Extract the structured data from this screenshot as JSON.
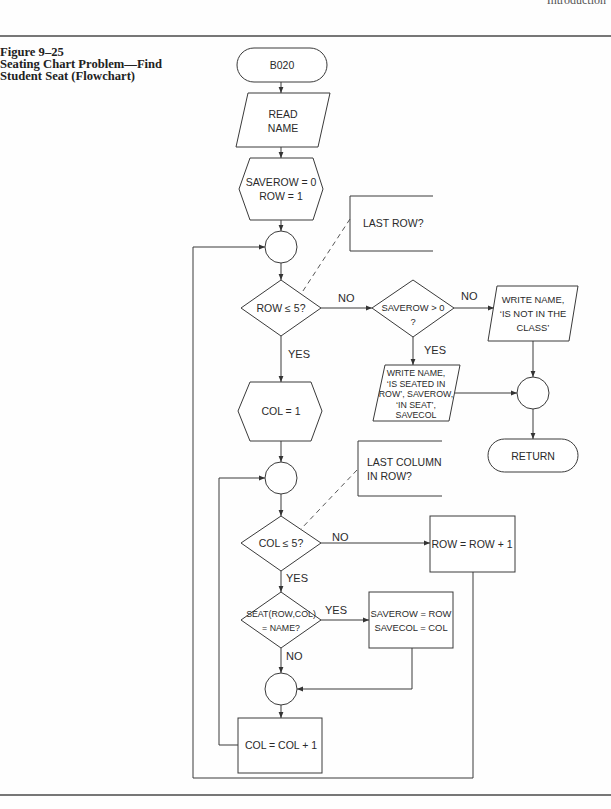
{
  "page": {
    "running_header": "Introduction"
  },
  "figure": {
    "label": "Figure 9–25",
    "caption_lines": [
      "Seating Chart Problem—Find",
      "Student Seat (Flowchart)"
    ]
  },
  "flowchart": {
    "nodes": {
      "start": {
        "shape": "terminal",
        "text": "B020"
      },
      "read_name": {
        "shape": "input-output",
        "lines": [
          "READ",
          "NAME"
        ]
      },
      "init_row": {
        "shape": "preparation",
        "lines": [
          "SAVEROW = 0",
          "ROW = 1"
        ]
      },
      "row_loop_connector": {
        "shape": "connector"
      },
      "row_test": {
        "shape": "decision",
        "text": "ROW ≤ 5?"
      },
      "found_test": {
        "shape": "decision",
        "lines": [
          "SAVEROW > 0",
          "?"
        ]
      },
      "write_not_in_class": {
        "shape": "input-output",
        "lines": [
          "WRITE NAME,",
          "‘IS NOT IN THE",
          "CLASS’"
        ]
      },
      "write_seated": {
        "shape": "input-output",
        "lines": [
          "WRITE NAME,",
          "‘IS SEATED IN",
          "ROW’, SAVEROW,",
          "‘IN SEAT’,",
          "SAVECOL"
        ]
      },
      "exit_connector": {
        "shape": "connector"
      },
      "return": {
        "shape": "terminal",
        "text": "RETURN"
      },
      "init_col": {
        "shape": "preparation",
        "text": "COL = 1"
      },
      "col_loop_connector": {
        "shape": "connector"
      },
      "col_test": {
        "shape": "decision",
        "text": "COL ≤ 5?"
      },
      "row_increment": {
        "shape": "process",
        "text": "ROW = ROW + 1"
      },
      "seat_test": {
        "shape": "decision",
        "lines": [
          "SEAT(ROW,COL)",
          "= NAME?"
        ]
      },
      "save_position": {
        "shape": "process",
        "lines": [
          "SAVEROW = ROW",
          "SAVECOL = COL"
        ]
      },
      "merge_connector": {
        "shape": "connector"
      },
      "col_increment": {
        "shape": "process",
        "text": "COL = COL + 1"
      }
    },
    "annotations": {
      "row_test_note": {
        "lines": [
          "LAST ROW?"
        ]
      },
      "col_test_note": {
        "lines": [
          "LAST COLUMN",
          "IN ROW?"
        ]
      }
    },
    "edge_labels": {
      "row_test_no": "NO",
      "row_test_yes": "YES",
      "found_test_no": "NO",
      "found_test_yes": "YES",
      "col_test_no": "NO",
      "col_test_yes": "YES",
      "seat_test_yes": "YES",
      "seat_test_no": "NO"
    },
    "colors": {
      "line": "#3a3a3a",
      "text": "#2a2a2a",
      "background": "#ffffff"
    }
  }
}
